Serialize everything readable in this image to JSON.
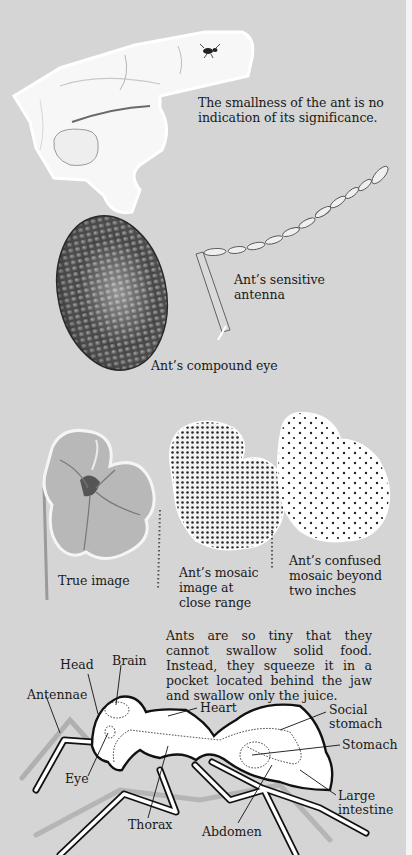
{
  "illustrations": {
    "finger": {
      "caption": "The smallness of the ant is no indication of its significance.",
      "caption_lines": [
        "The smallness of the ant is no",
        "indication of its significance."
      ]
    },
    "antenna": {
      "caption_lines": [
        "Ant’s sensitive",
        "antenna"
      ]
    },
    "compound_eye": {
      "caption": "Ant’s compound eye"
    },
    "vision_comparison": [
      {
        "caption_lines": [
          "True image"
        ]
      },
      {
        "caption_lines": [
          "Ant’s mosaic",
          "image at",
          "close range"
        ]
      },
      {
        "caption_lines": [
          "Ant’s confused",
          "mosaic beyond",
          "two inches"
        ]
      }
    ]
  },
  "anatomy": {
    "paragraph": "Ants are so tiny that they cannot swallow solid food. Instead, they squeeze it in a pocket located behind the jaw and swallow only the juice.",
    "labels": {
      "head": "Head",
      "brain": "Brain",
      "antennae": "Antennae",
      "heart": "Heart",
      "social_stomach_1": "Social",
      "social_stomach_2": "stomach",
      "stomach": "Stomach",
      "eye": "Eye",
      "large_intestine_1": "Large",
      "large_intestine_2": "intestine",
      "thorax": "Thorax",
      "abdomen": "Abdomen"
    }
  }
}
